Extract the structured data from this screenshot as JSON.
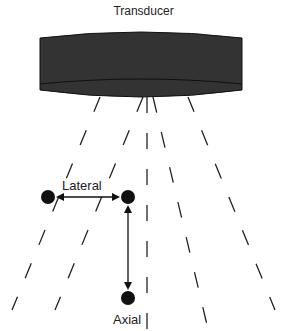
{
  "diagram": {
    "title": "Transducer",
    "labels": {
      "lateral": "Lateral",
      "axial": "Axial"
    },
    "colors": {
      "transducer_fill": "#333333",
      "transducer_edge": "#111111",
      "line": "#222222",
      "dot": "#111111",
      "background": "#ffffff"
    },
    "transducer": {
      "x": 40,
      "y": 32,
      "width": 202,
      "height": 65
    },
    "beam_lines": [
      {
        "x1": 100,
        "y1": 97,
        "x2": 12,
        "y2": 310
      },
      {
        "x1": 143,
        "y1": 97,
        "x2": 55,
        "y2": 310
      },
      {
        "x1": 147,
        "y1": 97,
        "x2": 147,
        "y2": 330
      },
      {
        "x1": 153,
        "y1": 97,
        "x2": 207,
        "y2": 325
      },
      {
        "x1": 188,
        "y1": 97,
        "x2": 275,
        "y2": 310
      }
    ],
    "points": [
      {
        "name": "left-point",
        "cx": 48,
        "cy": 197,
        "r": 7
      },
      {
        "name": "right-point",
        "cx": 128,
        "cy": 197,
        "r": 7
      },
      {
        "name": "bottom-point",
        "cx": 128,
        "cy": 298,
        "r": 7
      }
    ],
    "arrows": [
      {
        "name": "lateral-arrow",
        "x1": 58,
        "y1": 197,
        "x2": 118,
        "y2": 197
      },
      {
        "name": "axial-arrow",
        "x1": 128,
        "y1": 207,
        "x2": 128,
        "y2": 288
      }
    ]
  }
}
